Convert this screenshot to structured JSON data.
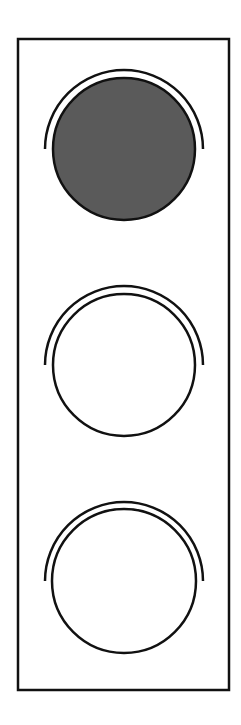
{
  "diagram": {
    "type": "traffic-light",
    "colors": {
      "background": "#ffffff",
      "stroke": "#111111",
      "lit_fill": "#5a5a5a",
      "unlit_fill": "#ffffff"
    },
    "housing": {
      "x": 18,
      "y": 39,
      "width": 211,
      "height": 651
    },
    "lights": [
      {
        "position": "top",
        "state": "on",
        "cx": 124,
        "cy": 149,
        "r": 71,
        "visor_r": 79
      },
      {
        "position": "middle",
        "state": "off",
        "cx": 124,
        "cy": 365,
        "r": 71,
        "visor_r": 79
      },
      {
        "position": "bottom",
        "state": "off",
        "cx": 124,
        "cy": 581,
        "r": 72,
        "visor_r": 79
      }
    ]
  }
}
